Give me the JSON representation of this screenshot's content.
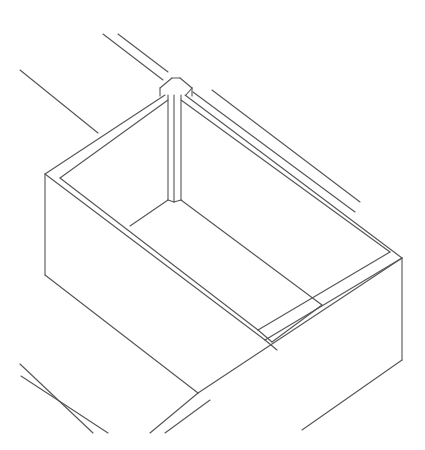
{
  "figure": {
    "stroke_color": "#555555",
    "background": "#ffffff"
  },
  "elements": {
    "background_wall_lines": [
      [
        20,
        70,
        98,
        133
      ],
      [
        103,
        34,
        163,
        80
      ],
      [
        118,
        34,
        168,
        72
      ],
      [
        193,
        92,
        355,
        212
      ],
      [
        212,
        90,
        360,
        202
      ]
    ],
    "corner_post": [
      [
        160,
        88,
        172,
        78
      ],
      [
        172,
        78,
        180,
        78
      ],
      [
        180,
        78,
        192,
        88
      ],
      [
        192,
        88,
        186,
        95
      ],
      [
        160,
        88,
        160,
        96
      ],
      [
        192,
        88,
        192,
        96
      ],
      [
        168,
        95,
        168,
        200
      ],
      [
        174,
        95,
        174,
        202
      ],
      [
        181,
        95,
        181,
        200
      ],
      [
        168,
        200,
        174,
        202
      ],
      [
        174,
        202,
        181,
        200
      ]
    ],
    "outer_rim": [
      [
        45,
        174,
        165,
        95
      ],
      [
        185,
        95,
        402,
        258
      ],
      [
        45,
        174,
        265,
        340
      ],
      [
        265,
        340,
        402,
        258
      ]
    ],
    "inner_rim": [
      [
        60,
        178,
        168,
        100
      ],
      [
        181,
        100,
        390,
        252
      ],
      [
        60,
        178,
        258,
        330
      ],
      [
        258,
        330,
        390,
        252
      ]
    ],
    "divider": [
      [
        130,
        226,
        168,
        200
      ],
      [
        181,
        200,
        322,
        305
      ],
      [
        272,
        342,
        322,
        305
      ]
    ],
    "divider_rim_lines": [
      [
        265,
        340,
        277,
        350
      ],
      [
        258,
        330,
        272,
        342
      ]
    ],
    "outer_walls": [
      [
        45,
        174,
        45,
        275
      ],
      [
        45,
        275,
        198,
        393
      ],
      [
        402,
        258,
        402,
        360
      ],
      [
        402,
        360,
        302,
        430
      ],
      [
        198,
        393,
        402,
        258
      ]
    ],
    "bottom_left_wall_lines": [
      [
        20,
        364,
        93,
        433
      ],
      [
        21,
        376,
        108,
        433
      ]
    ],
    "bottom_mid_wall_lines": [
      [
        150,
        433,
        198,
        393
      ],
      [
        165,
        433,
        210,
        400
      ]
    ]
  }
}
